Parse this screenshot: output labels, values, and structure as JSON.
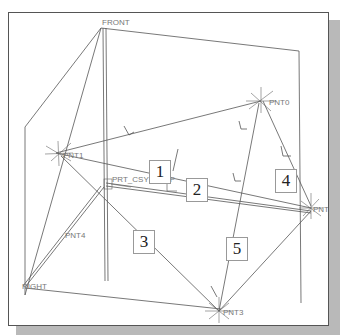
{
  "viewport": {
    "datum_planes": [
      "FRONT",
      "RIGHT"
    ],
    "points": [
      "PNT0",
      "PNT1",
      "PNT2",
      "PNT3",
      "PNT4"
    ],
    "csys": "PRT_CSYS_DEF"
  },
  "labels": {
    "front": "FRONT",
    "right": "RIGHT",
    "pnt0": "PNT0",
    "pnt1": "PNT1",
    "pnt2": "PNT2",
    "pnt3": "PNT3",
    "pnt4": "PNT4",
    "csys": "PRT_CSYS_DEF"
  },
  "callouts": [
    "1",
    "2",
    "3",
    "4",
    "5"
  ],
  "colors": {
    "line": "#555555",
    "label": "#777777",
    "frame": "#555555",
    "shadow": "#b9b9b9"
  }
}
